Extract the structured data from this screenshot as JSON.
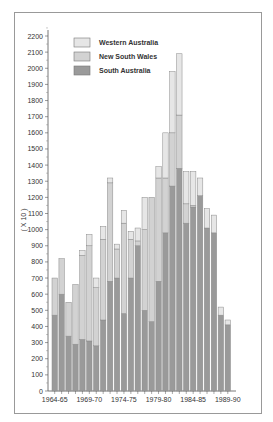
{
  "chart_data": {
    "type": "bar",
    "stacked": true,
    "title": "",
    "ylabel": "( X 10 )",
    "xlabel": "",
    "ylim": [
      0,
      2200
    ],
    "yticks": [
      0,
      100,
      200,
      300,
      400,
      500,
      600,
      700,
      800,
      900,
      1000,
      1100,
      1200,
      1300,
      1400,
      1500,
      1600,
      1700,
      1800,
      1900,
      2000,
      2100,
      2200
    ],
    "xtick_labels": [
      "1964-65",
      "1969-70",
      "1974-75",
      "1979-80",
      "1984-85",
      "1989-90"
    ],
    "categories": [
      "1964-65",
      "1965-66",
      "1966-67",
      "1967-68",
      "1968-69",
      "1969-70",
      "1970-71",
      "1971-72",
      "1972-73",
      "1973-74",
      "1974-75",
      "1975-76",
      "1976-77",
      "1977-78",
      "1978-79",
      "1979-80",
      "1980-81",
      "1981-82",
      "1982-83",
      "1983-84",
      "1984-85",
      "1985-86",
      "1986-87",
      "1987-88",
      "1988-89",
      "1989-90"
    ],
    "series": [
      {
        "name": "South Australia",
        "color": "#9a9a9a",
        "values": [
          470,
          600,
          340,
          290,
          320,
          310,
          280,
          440,
          680,
          700,
          480,
          700,
          900,
          500,
          430,
          680,
          980,
          1270,
          1380,
          1040,
          1140,
          1210,
          1010,
          980,
          470,
          410
        ]
      },
      {
        "name": "New South Wales",
        "color": "#d2d2d2",
        "values": [
          230,
          220,
          210,
          370,
          520,
          590,
          360,
          500,
          610,
          180,
          560,
          240,
          30,
          500,
          770,
          640,
          340,
          330,
          330,
          120,
          10,
          0,
          0,
          0,
          0,
          0
        ]
      },
      {
        "name": "Western Australia",
        "color": "#e6e6e6",
        "values": [
          0,
          0,
          0,
          0,
          30,
          70,
          60,
          80,
          30,
          30,
          80,
          50,
          80,
          200,
          0,
          70,
          280,
          380,
          380,
          200,
          210,
          110,
          120,
          110,
          50,
          30
        ]
      }
    ],
    "legend": [
      "Western Australia",
      "New South Wales",
      "South Australia"
    ],
    "legend_position": "upper-left",
    "grid": false
  }
}
